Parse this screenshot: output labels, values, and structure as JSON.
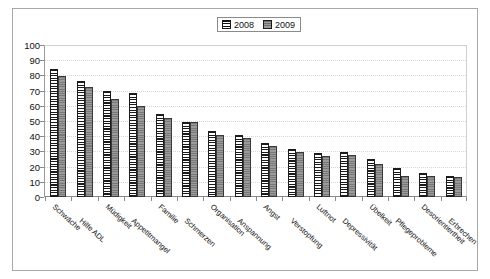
{
  "legend": {
    "position": "top-center",
    "entries": [
      {
        "label": "2008",
        "swatch": "striped-horizontal-black-white"
      },
      {
        "label": "2009",
        "swatch": "solid-gray"
      }
    ]
  },
  "axis": {
    "y_ticks": [
      "100",
      "90",
      "80",
      "70",
      "60",
      "50",
      "40",
      "30",
      "20",
      "10",
      "0"
    ]
  },
  "chart_data": {
    "type": "bar",
    "title": "",
    "subtitle": "",
    "xlabel": "",
    "ylabel": "",
    "ylim": [
      0,
      100
    ],
    "ytick_step": 10,
    "grid": true,
    "legend_position": "top-center",
    "categories": [
      "Schwäche",
      "Hilfe ADL",
      "Müdigkeit",
      "Appetitmangel",
      "Familie",
      "Schmerzen",
      "Organisation",
      "Anspannung",
      "Angst",
      "Verstopfung",
      "Luftnot",
      "Depressivität",
      "Übelkeit",
      "Pflegeprobleme",
      "Desorientiertheit",
      "Erbrechen"
    ],
    "series": [
      {
        "name": "2008",
        "color": "#ffffff",
        "pattern": "horizontal-stripes",
        "values": [
          85,
          77,
          70,
          69,
          55,
          50,
          44,
          41,
          36,
          32,
          29,
          30,
          25,
          19,
          16,
          14
        ]
      },
      {
        "name": "2009",
        "color": "#8e8e8e",
        "pattern": "solid-gray",
        "values": [
          80,
          73,
          65,
          60,
          52,
          50,
          41,
          39,
          34,
          30,
          27,
          28,
          22,
          14,
          14,
          13
        ]
      }
    ]
  }
}
